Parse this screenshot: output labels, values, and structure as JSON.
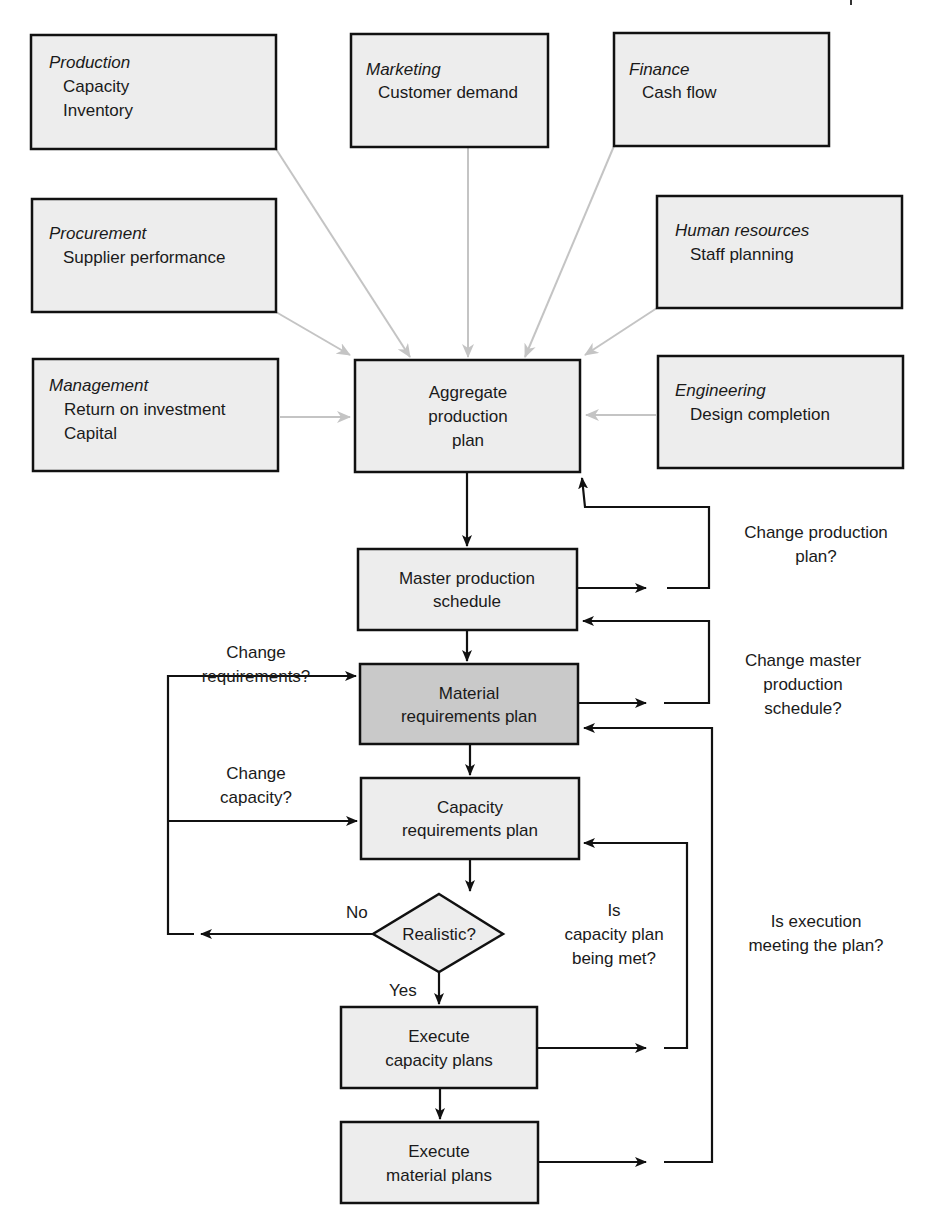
{
  "colors": {
    "box_fill": "#ededed",
    "box_fill_highlight": "#c9c9c9",
    "box_stroke": "#111111",
    "gray_arrow": "#c4c4c4",
    "black_arrow": "#111111",
    "text": "#1a1a1a"
  },
  "departments": [
    {
      "id": "production",
      "title": "Production",
      "items": [
        "Capacity",
        "Inventory"
      ]
    },
    {
      "id": "marketing",
      "title": "Marketing",
      "items": [
        "Customer demand"
      ]
    },
    {
      "id": "finance",
      "title": "Finance",
      "items": [
        "Cash flow"
      ]
    },
    {
      "id": "procurement",
      "title": "Procurement",
      "items": [
        "Supplier performance"
      ]
    },
    {
      "id": "human-resources",
      "title": "Human resources",
      "items": [
        "Staff planning"
      ]
    },
    {
      "id": "management",
      "title": "Management",
      "items": [
        "Return on investment",
        "Capital"
      ]
    },
    {
      "id": "engineering",
      "title": "Engineering",
      "items": [
        "Design completion"
      ]
    }
  ],
  "flow": {
    "aggregate_plan": [
      "Aggregate",
      "production",
      "plan"
    ],
    "master_schedule": [
      "Master production",
      "schedule"
    ],
    "material_requirements": [
      "Material",
      "requirements plan"
    ],
    "capacity_requirements": [
      "Capacity",
      "requirements plan"
    ],
    "decision": "Realistic?",
    "execute_capacity": [
      "Execute",
      "capacity plans"
    ],
    "execute_material": [
      "Execute",
      "material plans"
    ]
  },
  "labels": {
    "change_production_plan": [
      "Change production",
      "plan?"
    ],
    "change_master_schedule": [
      "Change master",
      "production",
      "schedule?"
    ],
    "change_requirements": [
      "Change",
      "requirements?"
    ],
    "change_capacity": [
      "Change",
      "capacity?"
    ],
    "no": "No",
    "yes": "Yes",
    "capacity_plan_met": [
      "Is",
      "capacity plan",
      "being met?"
    ],
    "execution_meeting_plan": [
      "Is execution",
      "meeting the plan?"
    ]
  }
}
